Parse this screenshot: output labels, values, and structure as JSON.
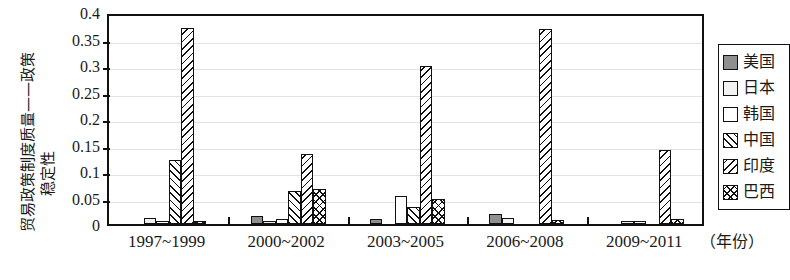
{
  "axis": {
    "y_title_line1": "贸易政策制度质量——政策",
    "y_title_line2": "稳定性",
    "x_unit": "（年份）",
    "y_ticks": [
      "0",
      "0.05",
      "0.1",
      "0.15",
      "0.2",
      "0.25",
      "0.3",
      "0.35",
      "0.4"
    ]
  },
  "legend": {
    "items": [
      {
        "label": "美国",
        "pattern": "solid-gray",
        "swatch": "sw-us"
      },
      {
        "label": "日本",
        "pattern": "light-gray",
        "swatch": "sw-jp"
      },
      {
        "label": "韩国",
        "pattern": "white",
        "swatch": "sw-kr"
      },
      {
        "label": "中国",
        "pattern": "diagonal-forward",
        "swatch": "sw-cn"
      },
      {
        "label": "印度",
        "pattern": "diagonal-back",
        "swatch": "sw-in"
      },
      {
        "label": "巴西",
        "pattern": "cross-hatch",
        "swatch": "sw-br"
      }
    ]
  },
  "chart_data": {
    "type": "bar",
    "title": "",
    "xlabel": "（年份）",
    "ylabel": "贸易政策制度质量——政策稳定性",
    "ylim": [
      0,
      0.4
    ],
    "ytick_step": 0.05,
    "grid": true,
    "legend_position": "right",
    "categories": [
      "1997~1999",
      "2000~2002",
      "2003~2005",
      "2006~2008",
      "2009~2011"
    ],
    "series": [
      {
        "name": "美国",
        "swatch": "sw-us",
        "values": [
          0.0,
          0.015,
          0.01,
          0.018,
          0.0
        ]
      },
      {
        "name": "日本",
        "swatch": "sw-jp",
        "values": [
          0.012,
          0.006,
          0.0,
          0.012,
          0.002
        ]
      },
      {
        "name": "韩国",
        "swatch": "sw-kr",
        "values": [
          0.002,
          0.01,
          0.053,
          0.0,
          0.001
        ]
      },
      {
        "name": "中国",
        "swatch": "sw-cn",
        "values": [
          0.12,
          0.063,
          0.033,
          0.0,
          0.0
        ]
      },
      {
        "name": "印度",
        "swatch": "sw-in",
        "values": [
          0.37,
          0.133,
          0.298,
          0.368,
          0.14
        ]
      },
      {
        "name": "巴西",
        "swatch": "sw-br",
        "values": [
          0.005,
          0.066,
          0.047,
          0.007,
          0.01
        ]
      }
    ]
  }
}
